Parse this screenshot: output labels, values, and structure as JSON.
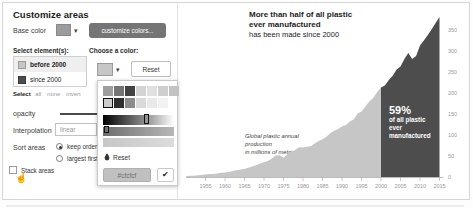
{
  "icons": {
    "caret": "▾",
    "check": "✔",
    "pointer": "☝"
  },
  "panel": {
    "title": "Customize areas",
    "base_color_label": "Base color",
    "base_color_swatch": "#9c9c9c",
    "customize_colors_button": "customize colors...",
    "select_header": "Select element(s):",
    "elements": [
      {
        "label": "before 2000",
        "color": "#c6c6c6",
        "selected": true
      },
      {
        "label": "since 2000",
        "color": "#4d4d4d",
        "selected": false
      }
    ],
    "select_label": "Select",
    "select_links": {
      "all": "all",
      "none": "none",
      "invert": "invert"
    },
    "opacity_label": "opacity",
    "interpolation_label": "Interpolation",
    "interpolation_value": "linear",
    "sort_label": "Sort areas",
    "sort_options": {
      "keep": "keep order",
      "largest": "largest first"
    },
    "sort_selected": "keep order",
    "stack_label": "Stack areas"
  },
  "color_picker": {
    "header": "Choose a color:",
    "current_swatch": "#c6c6c6",
    "reset_button": "Reset",
    "palette_row1": [
      "#9e9e9e",
      "#757575",
      "#424242",
      "#d4d4d4",
      "#e0e0e0",
      "#cfcfcf",
      "#c2c2c2"
    ],
    "palette_row2": [
      "#cccccc",
      "#2f2f2f",
      "#8c8c8c",
      "#d9d9d9",
      "#e9e9e9",
      "#f2f2f2"
    ],
    "selected_palette_color": "#cccccc",
    "reset_link": "Reset",
    "hex_value": "#cfcfcf"
  },
  "chart": {
    "title_line1": "More than half of all plastic",
    "title_line2": "ever manufactured",
    "title_line3": "has been made since 2000",
    "note_line1": "Global plastic annual production",
    "note_line2": "in millions of metric tons",
    "callout_pct": "59%",
    "callout_line1": "of all plastic",
    "callout_line2": "ever manufactured"
  },
  "chart_data": {
    "type": "area",
    "title": "More than half of all plastic ever manufactured has been made since 2000",
    "ylabel": "Global plastic annual production in millions of metric tons",
    "annotation": "59% of all plastic ever manufactured",
    "split_year": 2000,
    "colors": {
      "before_2000": "#c6c6c6",
      "since_2000": "#4d4d4d",
      "axis": "#bbbbbb",
      "tick_text": "#999999"
    },
    "x_ticks": [
      1955,
      1960,
      1965,
      1970,
      1975,
      1980,
      1985,
      1990,
      1995,
      2000,
      2005,
      2010,
      2015
    ],
    "y_ticks": [
      0,
      50,
      100,
      150,
      200,
      250,
      300,
      350
    ],
    "ylim": [
      0,
      380
    ],
    "xlim": [
      1950,
      2016
    ],
    "points": [
      [
        1950,
        2
      ],
      [
        1951,
        3
      ],
      [
        1952,
        3
      ],
      [
        1953,
        4
      ],
      [
        1954,
        5
      ],
      [
        1955,
        6
      ],
      [
        1956,
        7
      ],
      [
        1957,
        7
      ],
      [
        1958,
        8
      ],
      [
        1959,
        10
      ],
      [
        1960,
        11
      ],
      [
        1961,
        12
      ],
      [
        1962,
        14
      ],
      [
        1963,
        16
      ],
      [
        1964,
        18
      ],
      [
        1965,
        19
      ],
      [
        1966,
        22
      ],
      [
        1967,
        25
      ],
      [
        1968,
        28
      ],
      [
        1969,
        32
      ],
      [
        1970,
        35
      ],
      [
        1971,
        38
      ],
      [
        1972,
        44
      ],
      [
        1973,
        51
      ],
      [
        1974,
        52
      ],
      [
        1975,
        46
      ],
      [
        1976,
        54
      ],
      [
        1977,
        59
      ],
      [
        1978,
        64
      ],
      [
        1979,
        71
      ],
      [
        1980,
        70
      ],
      [
        1981,
        72
      ],
      [
        1982,
        73
      ],
      [
        1983,
        80
      ],
      [
        1984,
        86
      ],
      [
        1985,
        90
      ],
      [
        1986,
        96
      ],
      [
        1987,
        104
      ],
      [
        1988,
        110
      ],
      [
        1989,
        114
      ],
      [
        1990,
        120
      ],
      [
        1991,
        124
      ],
      [
        1992,
        132
      ],
      [
        1993,
        137
      ],
      [
        1994,
        151
      ],
      [
        1995,
        156
      ],
      [
        1996,
        168
      ],
      [
        1997,
        180
      ],
      [
        1998,
        188
      ],
      [
        1999,
        202
      ],
      [
        2000,
        213
      ],
      [
        2001,
        218
      ],
      [
        2002,
        231
      ],
      [
        2003,
        241
      ],
      [
        2004,
        256
      ],
      [
        2005,
        263
      ],
      [
        2006,
        281
      ],
      [
        2007,
        295
      ],
      [
        2008,
        281
      ],
      [
        2009,
        288
      ],
      [
        2010,
        313
      ],
      [
        2011,
        325
      ],
      [
        2012,
        338
      ],
      [
        2013,
        352
      ],
      [
        2014,
        367
      ],
      [
        2015,
        381
      ]
    ]
  }
}
